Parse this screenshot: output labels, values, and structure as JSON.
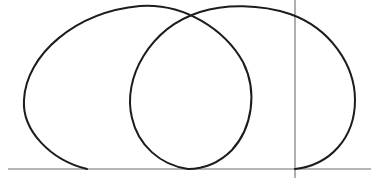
{
  "diagram": {
    "type": "parametric-curve",
    "colors": {
      "background": "#ffffff",
      "curve": "#1c1c1c",
      "axis": "#6e6e6e"
    },
    "axes": {
      "x_axis": {
        "x1": 8,
        "y1": 169,
        "x2": 371,
        "y2": 169
      },
      "y_axis": {
        "x1": 295,
        "y1": 0,
        "x2": 295,
        "y2": 178
      }
    },
    "curves": [
      {
        "name": "left-loop",
        "path": "M 87 169 C 50 160, 22 130, 24 100 C 26 55, 75 12, 140 6 C 185 3, 225 30, 243 62 C 258 92, 252 128, 232 150 C 218 164, 202 169, 188 169"
      },
      {
        "name": "right-loop",
        "path": "M 188 169 C 160 165, 138 145, 132 118 C 122 78, 150 28, 200 12 C 225 4, 260 4, 290 14 C 330 28, 355 65, 355 100 C 355 138, 330 165, 295 169"
      }
    ],
    "labels": []
  }
}
